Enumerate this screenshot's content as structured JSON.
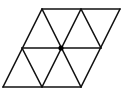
{
  "diagram": {
    "type": "triangular-grid-parallelogram",
    "stroke_color": "#111111",
    "background": "#ffffff",
    "rows": 2,
    "triangles": 8,
    "center_dot": true
  }
}
